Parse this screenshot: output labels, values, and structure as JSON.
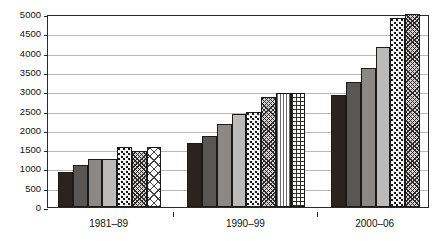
{
  "chart_data": {
    "type": "bar",
    "title": "",
    "subtitle": "",
    "xlabel": "",
    "ylabel": "",
    "ylim": [
      0,
      5000
    ],
    "grid": true,
    "legend": "none",
    "categories": [
      "1981–89",
      "1990–99",
      "2000–06"
    ],
    "y_ticks": [
      0,
      500,
      1000,
      1500,
      2000,
      2500,
      3000,
      3500,
      4000,
      4500,
      5000
    ],
    "y_tick_labels": [
      "0",
      "500",
      "1000",
      "1500",
      "2000",
      "2500",
      "3000",
      "3500",
      "4000",
      "4500",
      "5000"
    ],
    "groups": [
      {
        "category": "1981–89",
        "bars": [
          {
            "value": 900,
            "pattern": "solid-black"
          },
          {
            "value": 1100,
            "pattern": "solid-dark-gray"
          },
          {
            "value": 1250,
            "pattern": "solid-mid-gray"
          },
          {
            "value": 1250,
            "pattern": "solid-light-gray"
          },
          {
            "value": 1550,
            "pattern": "dots"
          },
          {
            "value": 1450,
            "pattern": "crosshatch"
          },
          {
            "value": 1550,
            "pattern": "diamond"
          }
        ]
      },
      {
        "category": "1990–99",
        "bars": [
          {
            "value": 1650,
            "pattern": "solid-black"
          },
          {
            "value": 1850,
            "pattern": "solid-dark-gray"
          },
          {
            "value": 2150,
            "pattern": "solid-mid-gray"
          },
          {
            "value": 2400,
            "pattern": "solid-light-gray"
          },
          {
            "value": 2450,
            "pattern": "dots"
          },
          {
            "value": 2850,
            "pattern": "crosshatch"
          },
          {
            "value": 2950,
            "pattern": "vertical-lines"
          },
          {
            "value": 2950,
            "pattern": "grid"
          }
        ]
      },
      {
        "category": "2000–06",
        "bars": [
          {
            "value": 2900,
            "pattern": "solid-black"
          },
          {
            "value": 3250,
            "pattern": "solid-dark-gray"
          },
          {
            "value": 3600,
            "pattern": "solid-mid-gray"
          },
          {
            "value": 4150,
            "pattern": "solid-light-gray"
          },
          {
            "value": 4900,
            "pattern": "dots"
          },
          {
            "value": 5000,
            "pattern": "crosshatch"
          }
        ]
      }
    ],
    "colors": {
      "solid-black": "#2b2320",
      "solid-dark-gray": "#595654",
      "solid-mid-gray": "#8b8886",
      "solid-light-gray": "#bdbbb9",
      "white": "#ffffff",
      "axis": "#2a2a2a",
      "gridline": "#b9b9b9",
      "background": "#ffffff"
    }
  }
}
